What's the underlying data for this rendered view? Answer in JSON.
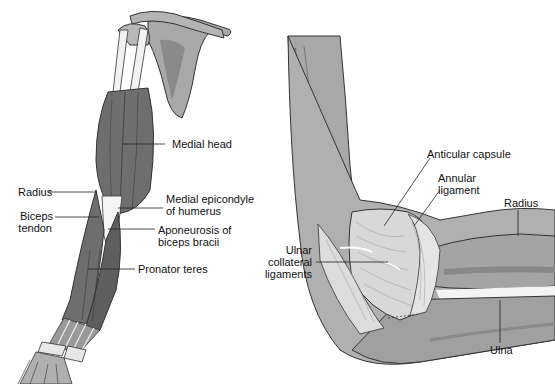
{
  "figure": {
    "left_panel": {
      "title": "Anterior arm muscles",
      "labels": {
        "medial_head": "Medial head",
        "radius": "Radius",
        "medial_epicondyle_1": "Medial epicondyle",
        "medial_epicondyle_2": "of humerus",
        "biceps_tendon_1": "Biceps",
        "biceps_tendon_2": "tendon",
        "aponeurosis_1": "Aponeurosis of",
        "aponeurosis_2": "biceps bracii",
        "pronator_teres": "Pronator teres"
      }
    },
    "right_panel": {
      "title": "Elbow joint ligaments",
      "labels": {
        "articular_capsule": "Anticular capsule",
        "annular_ligament_1": "Annular",
        "annular_ligament_2": "ligament",
        "radius": "Radius",
        "ulnar_collateral_1": "Ulnar",
        "ulnar_collateral_2": "collateral",
        "ulnar_collateral_3": "ligaments",
        "ulna": "Ulna"
      }
    },
    "colors": {
      "muscle": "#6e6e6e",
      "muscle_dark": "#4a4a4a",
      "bone": "#a8a8a8",
      "bone_light": "#c4c4c4",
      "ligament": "#dcdcdc",
      "tendon": "#f2f2f2",
      "outline": "#333333",
      "leader_line": "#222222"
    }
  }
}
